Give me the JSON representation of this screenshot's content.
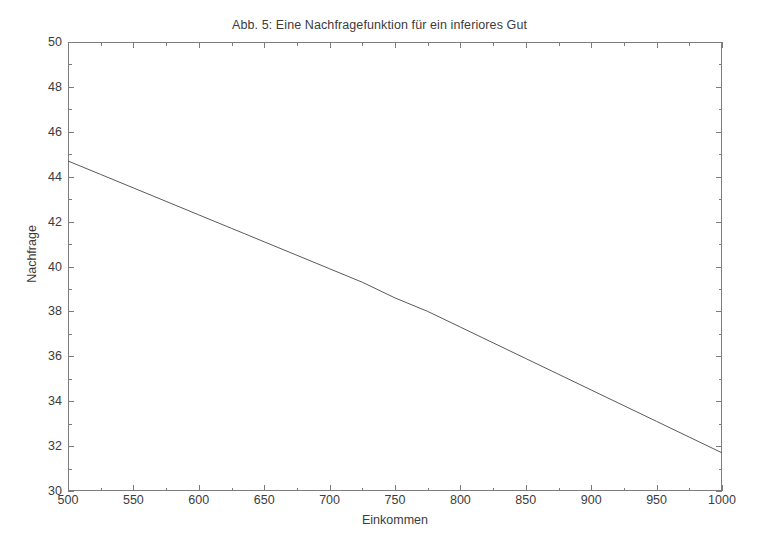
{
  "chart_data": {
    "type": "line",
    "title": "Abb. 5: Eine Nachfragefunktion für ein inferiores Gut",
    "xlabel": "Einkommen",
    "ylabel": "Nachfrage",
    "xlim": [
      500,
      1000
    ],
    "ylim": [
      30,
      50
    ],
    "xticks": [
      500,
      550,
      600,
      650,
      700,
      750,
      800,
      850,
      900,
      950,
      1000
    ],
    "yticks": [
      30,
      32,
      34,
      36,
      38,
      40,
      42,
      44,
      46,
      48,
      50
    ],
    "xminorticks": [
      525,
      575,
      625,
      675,
      725,
      775,
      825,
      875,
      925,
      975
    ],
    "yminorticks": [
      31,
      33,
      35,
      37,
      39,
      41,
      43,
      45,
      47,
      49
    ],
    "grid": false,
    "legend": null,
    "series": [
      {
        "name": "Nachfrage",
        "color": "#5a5a5a",
        "linewidth": 1,
        "x": [
          500,
          525,
          550,
          575,
          600,
          625,
          650,
          675,
          700,
          725,
          750,
          775,
          800,
          825,
          850,
          875,
          900,
          925,
          950,
          975,
          1000
        ],
        "values": [
          44.7,
          44.1,
          43.5,
          42.9,
          42.3,
          41.7,
          41.1,
          40.5,
          39.9,
          39.3,
          38.6,
          38.0,
          37.3,
          36.6,
          35.9,
          35.2,
          34.5,
          33.8,
          33.1,
          32.4,
          31.7
        ]
      }
    ]
  },
  "figure": {
    "background_color": "#ffffff",
    "axis_color": "#7d7d7d",
    "text_color": "#3c3c3c"
  }
}
